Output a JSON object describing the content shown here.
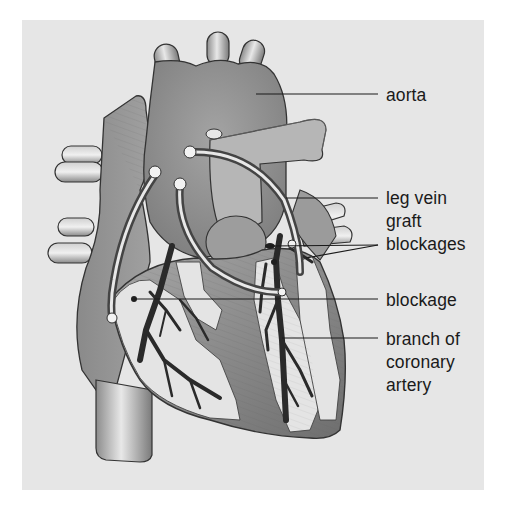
{
  "figure": {
    "background_color": "#e6e6e6",
    "labels": [
      {
        "id": "aorta",
        "lines": [
          "aorta"
        ]
      },
      {
        "id": "leg-vein-graft",
        "lines": [
          "leg vein",
          "graft"
        ]
      },
      {
        "id": "blockages",
        "lines": [
          "blockages"
        ]
      },
      {
        "id": "blockage",
        "lines": [
          "blockage"
        ]
      },
      {
        "id": "branch-of-coronary-artery",
        "lines": [
          "branch of",
          "coronary",
          "artery"
        ]
      }
    ]
  }
}
